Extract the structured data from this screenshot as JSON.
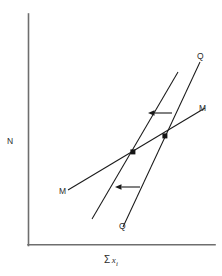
{
  "figure": {
    "caption_title": "",
    "background_color": "#ffffff",
    "line_color": "#1a1a1a",
    "axis_color": "#6e6e6e",
    "width": 222,
    "height": 276
  },
  "axes": {
    "y_axis_label": "N",
    "x_axis_label_sum": "Σ",
    "x_axis_label_var": "x",
    "x_axis_label_sub": "i",
    "x_axis_label_full": "Σ x i",
    "origin_x": 28,
    "origin_y": 245,
    "y_axis_top": 14,
    "x_axis_right": 215
  },
  "curves": {
    "q_shifted_label": "Q",
    "q_original_label": "Q",
    "m_right_label": "M",
    "m_left_label": "M"
  },
  "chart_data": {
    "type": "line",
    "title": "",
    "xlabel": "Σ x i",
    "ylabel": "N",
    "grid": false,
    "legend": "none",
    "axis_style": "L-shaped spine, no ticks, no tick labels",
    "xlim": [
      28,
      215
    ],
    "ylim": [
      14,
      245
    ],
    "annotations": [
      {
        "name": "upper-shift-arrow",
        "text": "",
        "direction": "left",
        "x_start": 172,
        "x_end": 148,
        "y": 113
      },
      {
        "name": "lower-shift-arrow",
        "text": "",
        "direction": "left",
        "x_start": 140,
        "x_end": 115,
        "y": 187
      }
    ],
    "markers": [
      {
        "name": "original-equilibrium",
        "x": 165,
        "y": 136
      },
      {
        "name": "new-equilibrium",
        "x": 133,
        "y": 152
      }
    ],
    "series": [
      {
        "name": "Q",
        "role": "original-supply-curve",
        "label": "Q",
        "points": [
          [
            123,
            227
          ],
          [
            200,
            62
          ]
        ]
      },
      {
        "name": "Q'",
        "role": "shifted-supply-curve",
        "label": "Q",
        "points": [
          [
            92,
            219
          ],
          [
            178,
            72
          ]
        ]
      },
      {
        "name": "M",
        "role": "demand-curve",
        "label": "M",
        "points": [
          [
            68,
            190
          ],
          [
            205,
            108
          ]
        ]
      }
    ]
  }
}
